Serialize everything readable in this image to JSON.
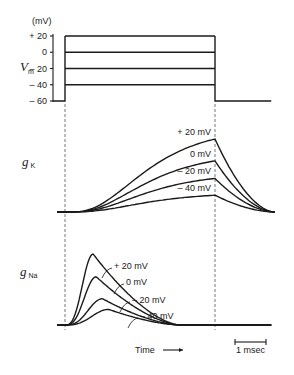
{
  "chart_data": [
    {
      "type": "line",
      "panel": "membrane-voltage",
      "title": "",
      "ylabel": "V",
      "ylabel_subscript": "m",
      "yunit_label": "(mV)",
      "ylim": [
        -60,
        20
      ],
      "yticks": [
        20,
        0,
        -20,
        -40,
        -60
      ],
      "ytick_labels": [
        "+ 20",
        "0",
        "– 20",
        "– 40",
        "– 60"
      ],
      "holding_potential": -60,
      "step_potentials": [
        20,
        0,
        -20,
        -40
      ],
      "step_start_ms": 0,
      "step_end_ms": 4.8,
      "record_end_ms": 6.6,
      "record_start_ms": -0.3
    },
    {
      "type": "line",
      "panel": "potassium-conductance",
      "ylabel": "g",
      "ylabel_subscript": "K",
      "series": [
        {
          "name": "+ 20 mV",
          "steady_fraction": 1.0
        },
        {
          "name": "0 mV",
          "steady_fraction": 0.7
        },
        {
          "name": "– 20 mV",
          "steady_fraction": 0.46
        },
        {
          "name": "– 40 mV",
          "steady_fraction": 0.23
        }
      ]
    },
    {
      "type": "line",
      "panel": "sodium-conductance",
      "ylabel": "g",
      "ylabel_subscript": "Na",
      "series": [
        {
          "name": "+ 20 mV",
          "peak_fraction": 1.0,
          "peak_ms": 0.9
        },
        {
          "name": "0 mV",
          "peak_fraction": 0.68,
          "peak_ms": 1.0
        },
        {
          "name": "– 20 mV",
          "peak_fraction": 0.37,
          "peak_ms": 1.2
        },
        {
          "name": "– 40 mV",
          "peak_fraction": 0.22,
          "peak_ms": 1.4
        }
      ]
    }
  ],
  "xlabel": "Time",
  "scale_bar_label": "1 msec",
  "scale_bar_ms": 1
}
